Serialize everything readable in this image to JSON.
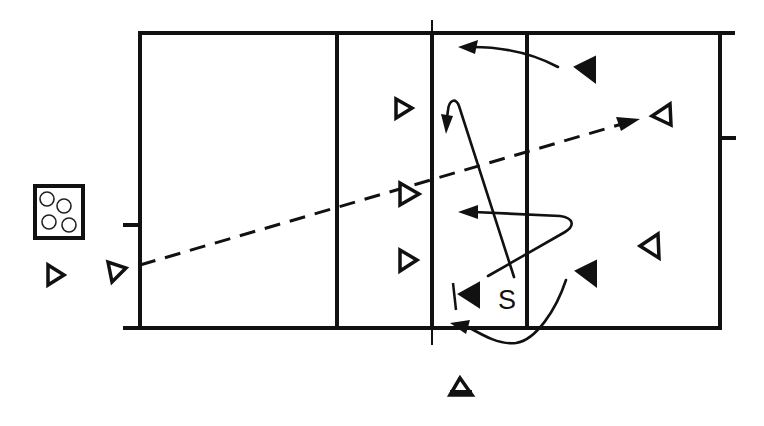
{
  "diagram": {
    "colors": {
      "line": "#111111",
      "background": "#ffffff"
    },
    "labels": {
      "server": "S"
    },
    "court": {
      "left_end_x": 140,
      "left_attack_x": 337,
      "net_x": 432,
      "right_attack_x": 527,
      "right_end_x": 720,
      "top_y": 33,
      "bottom_y": 328
    },
    "players": [
      {
        "id": "team-a-left-outside",
        "type": "open-triangle",
        "direction": "right"
      },
      {
        "id": "team-a-front-top",
        "type": "open-triangle",
        "direction": "right"
      },
      {
        "id": "team-a-front-middle",
        "type": "open-triangle",
        "direction": "right"
      },
      {
        "id": "team-a-front-bottom",
        "type": "open-triangle",
        "direction": "right"
      },
      {
        "id": "team-a-server",
        "type": "open-triangle",
        "direction": "right"
      },
      {
        "id": "team-b-top",
        "type": "solid-triangle",
        "direction": "left"
      },
      {
        "id": "team-b-right",
        "type": "open-triangle",
        "direction": "left"
      },
      {
        "id": "team-b-right-lower",
        "type": "open-triangle",
        "direction": "left"
      },
      {
        "id": "team-b-middle-lower",
        "type": "solid-triangle",
        "direction": "left"
      },
      {
        "id": "team-b-net-blocker",
        "type": "solid-triangle",
        "direction": "left"
      },
      {
        "id": "referee-bottom",
        "type": "open-triangle",
        "direction": "up"
      }
    ],
    "ball_cart": {
      "balls": 4
    }
  }
}
